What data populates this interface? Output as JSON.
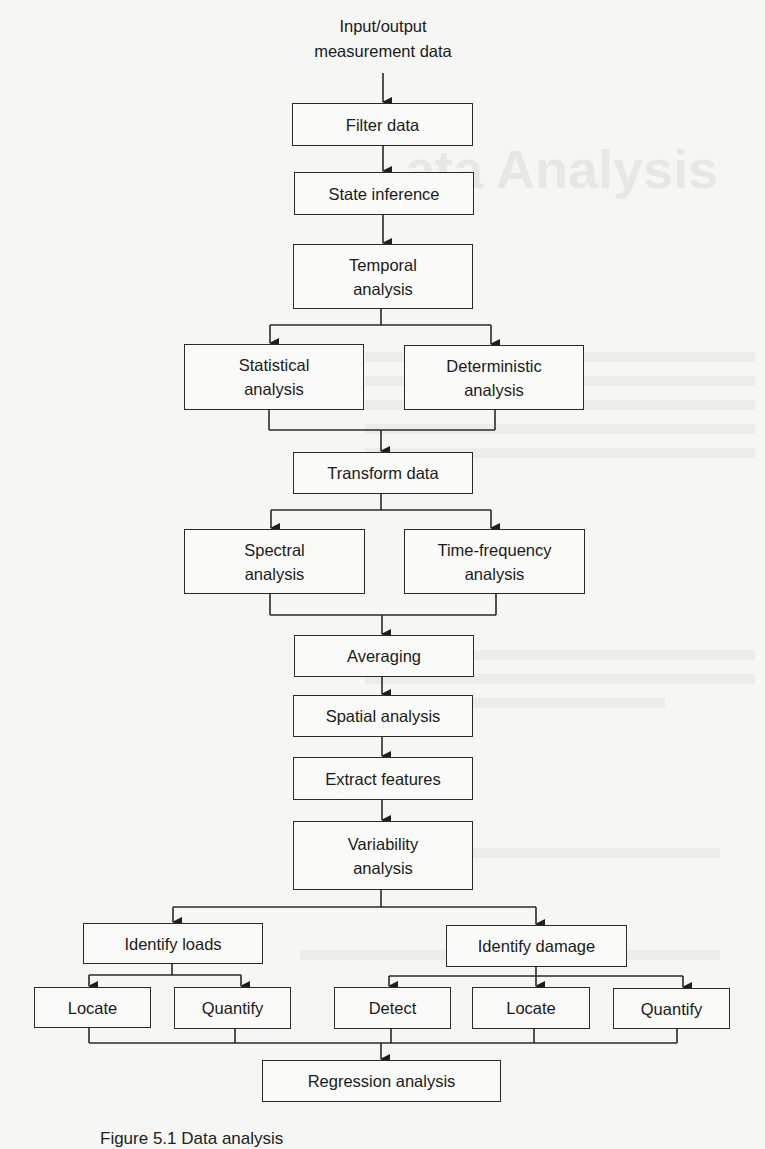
{
  "diagram": {
    "top_label": "Input/output measurement data",
    "top_label_lines": [
      "Input/output",
      "measurement data"
    ],
    "nodes": {
      "filter_data": "Filter data",
      "state_inference": "State inference",
      "temporal_analysis": "Temporal analysis",
      "statistical_analysis": "Statistical analysis",
      "deterministic_analysis": "Deterministic analysis",
      "transform_data": "Transform data",
      "spectral_analysis": "Spectral analysis",
      "time_frequency_analysis": "Time-frequency analysis",
      "averaging": "Averaging",
      "spatial_analysis": "Spatial analysis",
      "extract_features": "Extract features",
      "variability_analysis": "Variability analysis",
      "identify_loads": "Identify loads",
      "loads_locate": "Locate",
      "loads_quantify": "Quantify",
      "identify_damage": "Identify damage",
      "damage_detect": "Detect",
      "damage_locate": "Locate",
      "damage_quantify": "Quantify",
      "regression_analysis": "Regression analysis"
    },
    "edges": [
      [
        "top_label",
        "filter_data"
      ],
      [
        "filter_data",
        "state_inference"
      ],
      [
        "state_inference",
        "temporal_analysis"
      ],
      [
        "temporal_analysis",
        "statistical_analysis"
      ],
      [
        "temporal_analysis",
        "deterministic_analysis"
      ],
      [
        "statistical_analysis",
        "transform_data"
      ],
      [
        "deterministic_analysis",
        "transform_data"
      ],
      [
        "transform_data",
        "spectral_analysis"
      ],
      [
        "transform_data",
        "time_frequency_analysis"
      ],
      [
        "spectral_analysis",
        "averaging"
      ],
      [
        "time_frequency_analysis",
        "averaging"
      ],
      [
        "averaging",
        "spatial_analysis"
      ],
      [
        "spatial_analysis",
        "extract_features"
      ],
      [
        "extract_features",
        "variability_analysis"
      ],
      [
        "variability_analysis",
        "identify_loads"
      ],
      [
        "variability_analysis",
        "identify_damage"
      ],
      [
        "identify_loads",
        "loads_locate"
      ],
      [
        "identify_loads",
        "loads_quantify"
      ],
      [
        "identify_damage",
        "damage_detect"
      ],
      [
        "identify_damage",
        "damage_locate"
      ],
      [
        "identify_damage",
        "damage_quantify"
      ],
      [
        "loads_locate",
        "regression_analysis"
      ],
      [
        "loads_quantify",
        "regression_analysis"
      ],
      [
        "damage_detect",
        "regression_analysis"
      ],
      [
        "damage_locate",
        "regression_analysis"
      ],
      [
        "damage_quantify",
        "regression_analysis"
      ]
    ],
    "caption_partial": "Figure 5.1  Data analysis"
  },
  "colors": {
    "line": "#2a2a2a",
    "background": "#f6f6f4"
  }
}
